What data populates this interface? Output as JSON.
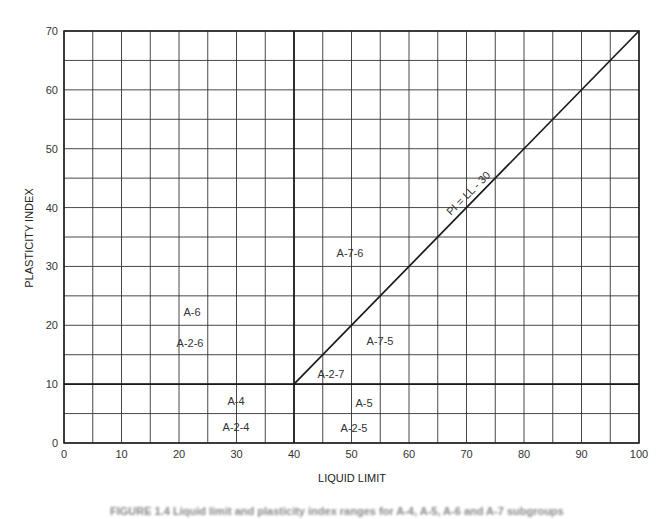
{
  "chart_data": {
    "type": "line",
    "title": "",
    "xlabel": "LIQUID LIMIT",
    "ylabel": "PLASTICITY INDEX",
    "xlim": [
      0,
      100
    ],
    "ylim": [
      0,
      70
    ],
    "grid": true,
    "grid_step_x": 5,
    "grid_step_y": 5,
    "x_ticks": [
      0,
      10,
      20,
      30,
      40,
      50,
      60,
      70,
      80,
      90,
      100
    ],
    "y_ticks": [
      0,
      10,
      20,
      30,
      40,
      50,
      60,
      70
    ],
    "series": [
      {
        "name": "PI = LL - 30",
        "x": [
          40,
          100
        ],
        "y": [
          10,
          70
        ]
      },
      {
        "name": "LL = 40 boundary",
        "x": [
          40,
          40
        ],
        "y": [
          0,
          70
        ]
      },
      {
        "name": "PI = 10 boundary",
        "x": [
          0,
          100
        ],
        "y": [
          10,
          10
        ]
      }
    ],
    "annotations": [
      {
        "text": "PI = LL - 30",
        "x": 71,
        "y": 41,
        "rotation": -45
      },
      {
        "text": "A-6",
        "x": 22,
        "y": 22
      },
      {
        "text": "A-2-6",
        "x": 22,
        "y": 17
      },
      {
        "text": "A-4",
        "x": 30,
        "y": 7
      },
      {
        "text": "A-2-4",
        "x": 30,
        "y": 2.5
      },
      {
        "text": "A-7-6",
        "x": 50,
        "y": 32
      },
      {
        "text": "A-7-5",
        "x": 55,
        "y": 18
      },
      {
        "text": "A-2-7",
        "x": 46,
        "y": 12
      },
      {
        "text": "A-5",
        "x": 52,
        "y": 7
      },
      {
        "text": "A-2-5",
        "x": 50,
        "y": 2.5
      }
    ],
    "legend": "none"
  },
  "axes": {
    "x_title": "LIQUID LIMIT",
    "y_title": "PLASTICITY INDEX"
  },
  "labels": {
    "line_label": "PI = LL - 30",
    "a6": "A-6",
    "a26": "A-2-6",
    "a4": "A-4",
    "a24": "A-2-4",
    "a76": "A-7-6",
    "a75": "A-7-5",
    "a27": "A-2-7",
    "a5": "A-5",
    "a25": "A-2-5"
  },
  "caption": "FIGURE 1.4   Liquid limit and plasticity index ranges for A-4, A-5, A-6 and A-7 subgroups"
}
